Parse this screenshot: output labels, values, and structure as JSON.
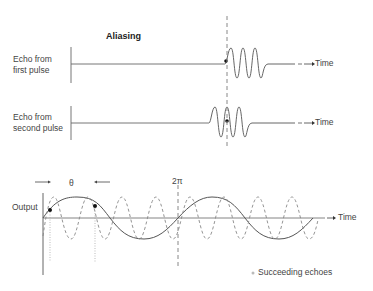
{
  "title": "Aliasing",
  "rows": [
    {
      "label_line1": "Echo from",
      "label_line2": "first pulse",
      "axis_label": "Time"
    },
    {
      "label_line1": "Echo from",
      "label_line2": "second pulse",
      "axis_label": "Time"
    }
  ],
  "output_panel": {
    "y_label": "Output",
    "x_label": "Time",
    "phase_label": "θ",
    "period_marker": "2π",
    "legend": "Succeeding echoes"
  },
  "colors": {
    "line": "#555555",
    "dashed": "#888888",
    "marker": "#111111",
    "axis": "#666666"
  }
}
